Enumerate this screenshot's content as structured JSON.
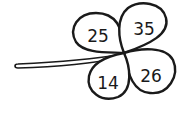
{
  "diagram": {
    "type": "four-leaf-clover",
    "leaves": [
      {
        "position": "top-left",
        "value": "25"
      },
      {
        "position": "top-right",
        "value": "35"
      },
      {
        "position": "bottom-left",
        "value": "14"
      },
      {
        "position": "bottom-right",
        "value": "26"
      }
    ],
    "colors": {
      "stroke": "#1a1a1a",
      "fill": "#ffffff"
    }
  }
}
